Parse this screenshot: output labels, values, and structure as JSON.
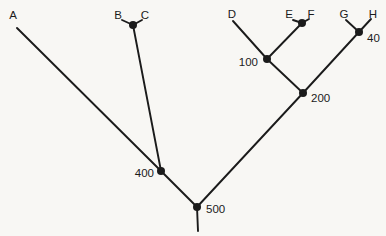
{
  "diagram": {
    "type": "cladogram",
    "background_color": "#f8f7f4",
    "line_color": "#1b1b1b",
    "text_color": "#1b1b1b",
    "line_width": 1.9,
    "node_radius": 4,
    "font_size": 11.5,
    "tips": [
      {
        "label": "A",
        "x": 13,
        "y": 15
      },
      {
        "label": "B",
        "x": 118,
        "y": 15
      },
      {
        "label": "C",
        "x": 145,
        "y": 15
      },
      {
        "label": "D",
        "x": 232,
        "y": 14
      },
      {
        "label": "E",
        "x": 289,
        "y": 14
      },
      {
        "label": "F",
        "x": 311,
        "y": 14
      },
      {
        "label": "G",
        "x": 344,
        "y": 14
      },
      {
        "label": "H",
        "x": 373,
        "y": 14
      }
    ],
    "internal_nodes": [
      {
        "id": "node-bc",
        "x": 133,
        "y": 25,
        "label": "",
        "label_x": 0,
        "label_y": 0,
        "anchor": "start"
      },
      {
        "id": "node-ef",
        "x": 302,
        "y": 23,
        "label": "",
        "label_x": 0,
        "label_y": 0,
        "anchor": "start"
      },
      {
        "id": "node-40",
        "x": 359,
        "y": 32,
        "label": "40",
        "label_x": 367,
        "label_y": 38,
        "anchor": "start"
      },
      {
        "id": "node-100",
        "x": 267,
        "y": 59,
        "label": "100",
        "label_x": 258,
        "label_y": 62,
        "anchor": "end"
      },
      {
        "id": "node-200",
        "x": 303,
        "y": 93,
        "label": "200",
        "label_x": 311,
        "label_y": 98,
        "anchor": "start"
      },
      {
        "id": "node-400",
        "x": 161,
        "y": 171,
        "label": "400",
        "label_x": 154,
        "label_y": 173,
        "anchor": "end"
      },
      {
        "id": "node-500",
        "x": 197,
        "y": 207,
        "label": "500",
        "label_x": 206,
        "label_y": 209,
        "anchor": "start"
      }
    ],
    "edges": [
      {
        "id": "edge-A-400",
        "x1": 17,
        "y1": 28,
        "x2": 161,
        "y2": 171
      },
      {
        "id": "edge-B-bc",
        "x1": 122,
        "y1": 20,
        "x2": 133,
        "y2": 25
      },
      {
        "id": "edge-C-bc",
        "x1": 142,
        "y1": 20,
        "x2": 133,
        "y2": 25
      },
      {
        "id": "edge-bc-400",
        "x1": 133,
        "y1": 25,
        "x2": 161,
        "y2": 171
      },
      {
        "id": "edge-D-100",
        "x1": 233,
        "y1": 21,
        "x2": 267,
        "y2": 59
      },
      {
        "id": "edge-E-ef",
        "x1": 293,
        "y1": 20,
        "x2": 302,
        "y2": 23
      },
      {
        "id": "edge-F-ef",
        "x1": 309,
        "y1": 19,
        "x2": 302,
        "y2": 23
      },
      {
        "id": "edge-ef-100",
        "x1": 302,
        "y1": 23,
        "x2": 267,
        "y2": 59
      },
      {
        "id": "edge-G-40",
        "x1": 346,
        "y1": 20,
        "x2": 359,
        "y2": 32
      },
      {
        "id": "edge-H-40",
        "x1": 371,
        "y1": 19,
        "x2": 359,
        "y2": 32
      },
      {
        "id": "edge-100-200",
        "x1": 267,
        "y1": 59,
        "x2": 303,
        "y2": 93
      },
      {
        "id": "edge-40-200",
        "x1": 359,
        "y1": 32,
        "x2": 303,
        "y2": 93
      },
      {
        "id": "edge-200-500",
        "x1": 303,
        "y1": 93,
        "x2": 197,
        "y2": 207
      },
      {
        "id": "edge-400-500",
        "x1": 161,
        "y1": 171,
        "x2": 197,
        "y2": 207
      },
      {
        "id": "edge-root",
        "x1": 197,
        "y1": 207,
        "x2": 198,
        "y2": 231
      }
    ]
  }
}
